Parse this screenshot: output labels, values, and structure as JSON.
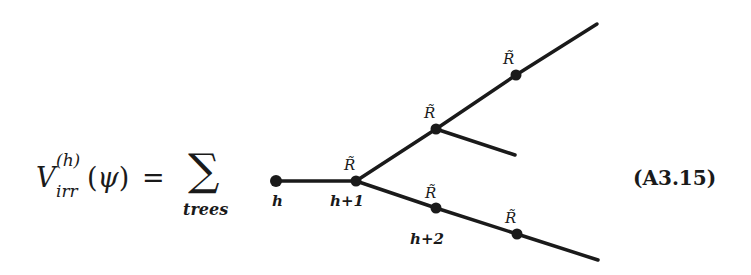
{
  "equation": {
    "lhs_symbol": "V",
    "lhs_superscript": "(h)",
    "lhs_subscript": "irr",
    "lhs_open": "(",
    "lhs_argument": "ψ",
    "lhs_close": ")",
    "equals": "=",
    "sum_symbol": "∑",
    "sum_subscript": "trees",
    "equation_number": "(A3.15)"
  },
  "tree": {
    "vertex_label": "R̃",
    "scale_labels": [
      "h",
      "h+1",
      "h+2"
    ]
  }
}
